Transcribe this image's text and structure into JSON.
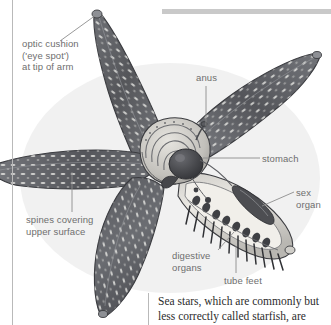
{
  "page": {
    "width": 331,
    "height": 325,
    "background": "#ffffff",
    "kind": "printed-encyclopedia-page-scan"
  },
  "rules": {
    "left_vertical_rule_color": "#b9b9b9",
    "top_horizontal_bar_color": "#c9c9c9",
    "body_column_rule_color": "#b9b9b9"
  },
  "illustration": {
    "subject": "sea star (starfish) anatomy, cutaway view",
    "style": "engraved grayscale halftone",
    "arm_count": 5,
    "colors": {
      "arm_dark": "#55565a",
      "arm_mid": "#6f7176",
      "arm_light": "#9a9ca1",
      "spine_speck": "#f2f2ef",
      "outline": "#3c3d41",
      "cutaway_pale": "#e3e1dc",
      "stomach_dark": "#4a4b4f",
      "shadow": "#c8c8c6"
    }
  },
  "labels": [
    {
      "id": "optic-cushion",
      "name": "optic-cushion-label",
      "text": "optic cushion\n('eye spot')\nat tip of arm",
      "color": "#6e6e6e",
      "leader": "diagonal up-right to upper-left arm tip"
    },
    {
      "id": "spines",
      "name": "spines-label",
      "text": "spines covering\nupper surface",
      "color": "#6e6e6e",
      "leader": "vertical up to left arm surface"
    },
    {
      "id": "anus",
      "name": "anus-label",
      "text": "anus",
      "color": "#6e6e6e",
      "leader": "vertical down to central disc"
    },
    {
      "id": "stomach",
      "name": "stomach-label",
      "text": "stomach",
      "color": "#6e6e6e",
      "leader": "horizontal left to dark stomach sac"
    },
    {
      "id": "sex-organ",
      "name": "sex-organ-label",
      "text": "sex\norgan",
      "color": "#6e6e6e",
      "leader": "horizontal left to gonad in dissected arm"
    },
    {
      "id": "digestive-organs",
      "name": "digestive-organs-label",
      "text": "digestive\norgans",
      "color": "#6e6e6e",
      "leader": "diagonal up-right into dissected arm"
    },
    {
      "id": "tube-feet",
      "name": "tube-feet-label",
      "text": "tube feet",
      "color": "#6e6e6e",
      "leader": "vertical up to row of tube feet"
    }
  ],
  "body": {
    "lines": [
      "Sea stars, which are commonly but",
      "less correctly called starfish, are"
    ],
    "text": "Sea stars, which are commonly but less correctly called starfish, are",
    "color": "#2c2c2c"
  }
}
